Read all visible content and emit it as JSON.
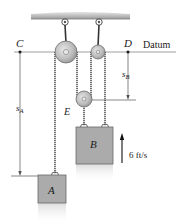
{
  "figure": {
    "type": "pulley-system",
    "labels": {
      "point_c": "C",
      "point_d": "D",
      "datum": "Datum",
      "pulley_e": "E",
      "block_a": "A",
      "block_b": "B",
      "s_a_main": "s",
      "s_a_sub": "A",
      "s_b_main": "s",
      "s_b_sub": "B",
      "velocity": "6 ft/s"
    },
    "colors": {
      "ceiling": "#b9b9b9",
      "pulley_fill": "#bdbdbd",
      "pulley_hub": "#e2e2e2",
      "block_fill": "#ababab",
      "block_edge": "#6a6a6a",
      "cable": "#3a3a3a",
      "dim_line": "#555555"
    }
  }
}
